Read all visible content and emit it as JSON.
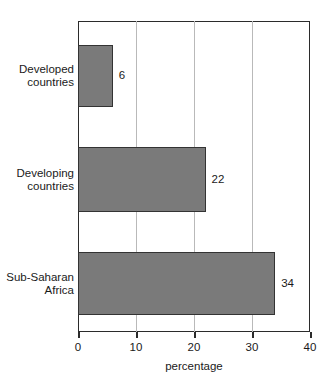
{
  "chart_data": {
    "type": "bar",
    "orientation": "horizontal",
    "title": "",
    "xlabel": "percentage",
    "ylabel": "",
    "xlim": [
      0,
      40
    ],
    "xticks": [
      0,
      10,
      20,
      30,
      40
    ],
    "xtick_labels": [
      "0",
      "10",
      "20",
      "30",
      "40"
    ],
    "gridlines_x": [
      10,
      20,
      30
    ],
    "grid": true,
    "legend": false,
    "categories": [
      "Developed countries",
      "Developing countries",
      "Sub-Saharan Africa"
    ],
    "category_lines": [
      [
        "Developed",
        "countries"
      ],
      [
        "Developing",
        "countries"
      ],
      [
        "Sub-Saharan",
        "Africa"
      ]
    ],
    "values": [
      6,
      22,
      34
    ],
    "value_labels": [
      "6",
      "22",
      "34"
    ],
    "bar_color": "#7a7a7a",
    "bar_border_color": "#333333",
    "axis_color": "#2b2b2b",
    "grid_color": "#b9b9b9",
    "background": "#ffffff"
  }
}
